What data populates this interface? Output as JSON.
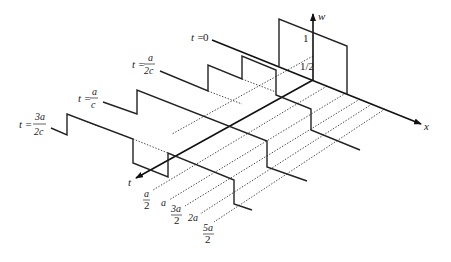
{
  "figure": {
    "axes": {
      "w_label": "w",
      "x_label": "x",
      "t_label": "t"
    },
    "w_ticks": {
      "one": "1",
      "half": "1/2"
    },
    "time_labels": [
      {
        "prefix": "t =",
        "value": "0"
      },
      {
        "prefix": "t =",
        "num": "a",
        "den": "2c"
      },
      {
        "prefix": "t =",
        "num": "a",
        "den": "c"
      },
      {
        "prefix": "t =",
        "num": "3a",
        "den": "2c"
      }
    ],
    "x_labels": [
      {
        "num": "a",
        "den": "2"
      },
      {
        "single": "a"
      },
      {
        "num": "3a",
        "den": "2"
      },
      {
        "single": "2a"
      },
      {
        "num": "5a",
        "den": "2"
      }
    ]
  }
}
